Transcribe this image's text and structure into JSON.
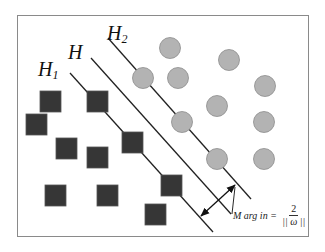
{
  "diagram": {
    "colors": {
      "frame": "#8a8a8a",
      "square_fill": "#363636",
      "square_stroke": "#555555",
      "circle_fill": "#b3b3b3",
      "circle_stroke": "#8c8c8c",
      "line": "#222222"
    },
    "labels": {
      "h1": {
        "main": "H",
        "sub": "1"
      },
      "h": {
        "main": "H",
        "sub": ""
      },
      "h2": {
        "main": "H",
        "sub": "2"
      }
    },
    "formula": {
      "lhs": "M arg in",
      "equals": "=",
      "numerator": "2",
      "denominator": "|| ω ||"
    },
    "class_negative_squares": [
      {
        "x": 40,
        "y": 91
      },
      {
        "x": 87,
        "y": 91
      },
      {
        "x": 26,
        "y": 114
      },
      {
        "x": 56,
        "y": 138
      },
      {
        "x": 87,
        "y": 147
      },
      {
        "x": 122,
        "y": 132
      },
      {
        "x": 161,
        "y": 175
      },
      {
        "x": 145,
        "y": 204
      },
      {
        "x": 45,
        "y": 185
      },
      {
        "x": 97,
        "y": 185
      }
    ],
    "class_positive_circles": [
      {
        "cx": 170,
        "cy": 48
      },
      {
        "cx": 143,
        "cy": 78
      },
      {
        "cx": 178,
        "cy": 78
      },
      {
        "cx": 182,
        "cy": 122
      },
      {
        "cx": 229,
        "cy": 60
      },
      {
        "cx": 265,
        "cy": 86
      },
      {
        "cx": 217,
        "cy": 106
      },
      {
        "cx": 264,
        "cy": 122
      },
      {
        "cx": 217,
        "cy": 159
      },
      {
        "cx": 264,
        "cy": 159
      }
    ],
    "hyperplanes": [
      {
        "name": "H1",
        "x1": 70,
        "y1": 73,
        "x2": 213,
        "y2": 232
      },
      {
        "name": "H",
        "x1": 91,
        "y1": 58,
        "x2": 231,
        "y2": 214
      },
      {
        "name": "H2",
        "x1": 108,
        "y1": 38,
        "x2": 251,
        "y2": 199
      }
    ],
    "margin_arrow": {
      "x1": 201,
      "y1": 216,
      "x2": 235,
      "y2": 185
    }
  }
}
